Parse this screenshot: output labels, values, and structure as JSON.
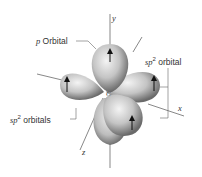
{
  "diagram": {
    "center_atom": "C",
    "axes": {
      "x": "x",
      "y": "y",
      "z": "z"
    },
    "labels": {
      "p_orbital": {
        "prefix": "p",
        "text": " Orbital"
      },
      "sp2_orbital": {
        "prefix": "sp",
        "sup": "2",
        "text": " orbital"
      },
      "sp2_orbitals": {
        "prefix": "sp",
        "sup": "2",
        "text": " orbitals"
      }
    },
    "colors": {
      "lobe_light": "#f2f2f2",
      "lobe_mid": "#b8b8b8",
      "lobe_dark": "#6e6e6e",
      "line": "#555555",
      "arrow": "#111111"
    }
  }
}
